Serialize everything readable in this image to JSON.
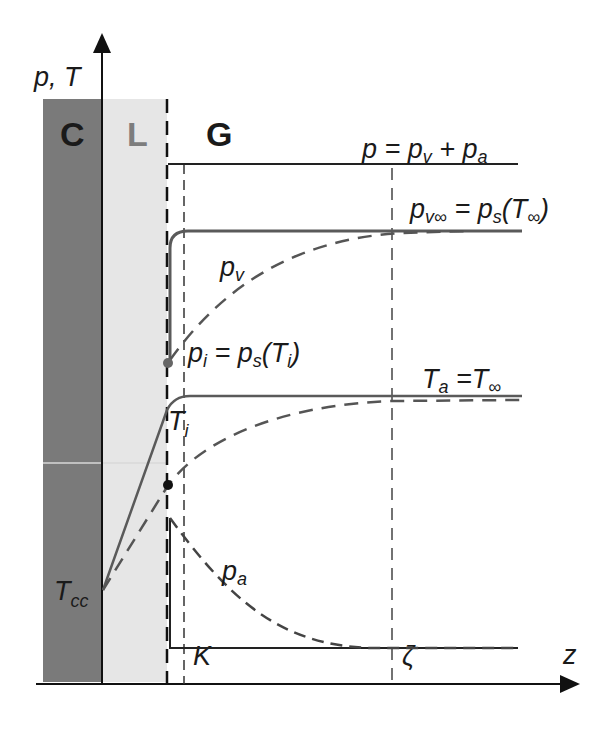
{
  "figure": {
    "y_axis_label": "p, T",
    "x_axis_label": "z",
    "regions": [
      {
        "label": "C",
        "color": "#7a7a7a"
      },
      {
        "label": "L",
        "color": "#e6e6e6",
        "text_color": "#7d7d7d"
      },
      {
        "label": "G",
        "color": "#ffffff"
      }
    ],
    "markers": {
      "K": "K",
      "zeta": "ζ"
    },
    "curves": {
      "total_pressure": {
        "main": "p = p",
        "sub_v": "v",
        "plus": " + p",
        "sub_a": "a"
      },
      "vapor_far": {
        "main": "p",
        "sub1": "v∞",
        "eq": " = p",
        "sub2": "s",
        "paren_open": "(T",
        "sub3": "∞",
        "paren_close": ")"
      },
      "vapor_pressure": {
        "main": "p",
        "sub": "v"
      },
      "interface_pressure": {
        "main": "p",
        "sub1": "i",
        "eq": " = p",
        "sub2": "s",
        "paren_open": "(T",
        "sub3": "i",
        "paren_close": ")"
      },
      "temperature_far": {
        "main": "T",
        "sub1": "a",
        "eq": " =T",
        "sub2": "∞"
      },
      "interface_temperature": {
        "main": "T",
        "sub": "i"
      },
      "air_pressure": {
        "main": "p",
        "sub": "a"
      },
      "cold_temperature": {
        "main": "T",
        "sub": "cc"
      }
    },
    "colors": {
      "solid_gray": "#5a5a5a",
      "dashed_gray": "#555555",
      "axis": "#111111"
    }
  }
}
